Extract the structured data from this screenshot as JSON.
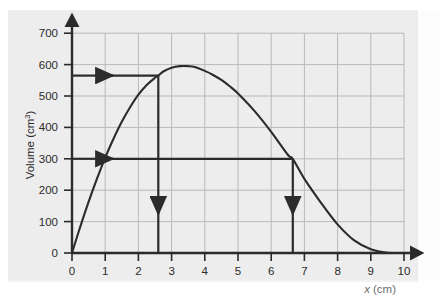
{
  "figure": {
    "name": "volume-vs-x-graph",
    "background_color": "#ededed",
    "page_color": "#ffffff",
    "ink_color": "#2b2b2b",
    "grid_color": "#b9b9b9"
  },
  "chart_data": {
    "type": "line",
    "title": "",
    "xlabel": "x (cm)",
    "xlabel_variable": "x",
    "xlabel_unit": "(cm)",
    "ylabel": "Volume (cm3)",
    "ylabel_base": "Volume (cm",
    "ylabel_sup": "3",
    "ylabel_close": ")",
    "xlim": [
      0,
      10
    ],
    "ylim": [
      0,
      700
    ],
    "xticks": [
      0,
      1,
      2,
      3,
      4,
      5,
      6,
      7,
      8,
      9,
      10
    ],
    "xticklabels": [
      "0",
      "1",
      "2",
      "3",
      "4",
      "5",
      "6",
      "7",
      "8",
      "9",
      "10"
    ],
    "yticks": [
      0,
      100,
      200,
      300,
      400,
      500,
      600,
      700
    ],
    "yticklabels": [
      "0",
      "100",
      "200",
      "300",
      "400",
      "500",
      "600",
      "700"
    ],
    "grid": true,
    "grid_x_step": 1,
    "grid_y_step": 100,
    "legend": "none",
    "axis_arrows": true,
    "series": [
      {
        "name": "Volume curve",
        "comment": "smooth cubic-like curve through origin, maximum near x=3.7, returns to zero at x=10",
        "x": [
          0,
          0.25,
          0.5,
          0.75,
          1.0,
          1.25,
          1.5,
          1.75,
          2.0,
          2.25,
          2.5,
          2.6,
          2.75,
          3.0,
          3.25,
          3.5,
          3.7,
          4.0,
          4.25,
          4.5,
          4.75,
          5.0,
          5.5,
          6.0,
          6.5,
          6.65,
          7.0,
          7.5,
          8.0,
          8.5,
          9.0,
          9.5,
          10.0
        ],
        "y": [
          0,
          84,
          163,
          236,
          304,
          364,
          418,
          464,
          504,
          535,
          558,
          565,
          578,
          590,
          595,
          595,
          592,
          580,
          567,
          551,
          531,
          508,
          452,
          386,
          313,
          300,
          236,
          160,
          91,
          40,
          12,
          1,
          0
        ]
      }
    ],
    "annotations": {
      "horizontal_arrows": [
        {
          "name": "horizontal-arrow-upper",
          "value": 565,
          "from_x": 2.6,
          "to_x": 0,
          "arrowhead_at_x": 1.2,
          "direction": "left",
          "label": ""
        },
        {
          "name": "horizontal-arrow-lower",
          "value": 300,
          "from_x": 6.65,
          "to_x": 0,
          "arrowhead_at_x": 1.2,
          "direction": "left",
          "label": ""
        }
      ],
      "vertical_arrows": [
        {
          "name": "vertical-arrow-left",
          "x": 2.6,
          "from_y": 0,
          "to_y": 565,
          "arrowhead_at_y": 175,
          "direction": "up",
          "label": ""
        },
        {
          "name": "vertical-arrow-right",
          "x": 6.65,
          "from_y": 0,
          "to_y": 300,
          "arrowhead_at_y": 175,
          "direction": "up",
          "label": ""
        }
      ]
    }
  }
}
